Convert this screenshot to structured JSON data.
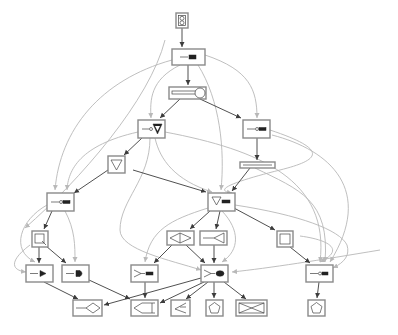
{
  "diagram": {
    "type": "directed-graph",
    "colors": {
      "background": "#ffffff",
      "node_border": "#8a8a8a",
      "edge_primary": "#3c3c3c",
      "edge_secondary": "#b8b8b8",
      "glyph": "#444444"
    },
    "nodes": [
      {
        "id": "n0",
        "glyph": "two-circles-in-box",
        "x": 176,
        "y": 13,
        "w": 12,
        "h": 15
      },
      {
        "id": "n1",
        "glyph": "wire-to-component",
        "x": 172,
        "y": 49,
        "w": 33,
        "h": 16
      },
      {
        "id": "n2",
        "glyph": "stretched-bar-with-circle",
        "x": 169,
        "y": 87,
        "w": 37,
        "h": 12
      },
      {
        "id": "n3",
        "glyph": "wire-to-filled-triangle",
        "x": 138,
        "y": 120,
        "w": 27,
        "h": 18
      },
      {
        "id": "n4",
        "glyph": "wire-to-component",
        "x": 243,
        "y": 120,
        "w": 27,
        "h": 18
      },
      {
        "id": "n5",
        "glyph": "inverted-triangle",
        "x": 108,
        "y": 156,
        "w": 17,
        "h": 17
      },
      {
        "id": "n6",
        "glyph": "long-bar",
        "x": 240,
        "y": 162,
        "w": 35,
        "h": 6
      },
      {
        "id": "n7",
        "glyph": "wire-to-component",
        "x": 47,
        "y": 193,
        "w": 27,
        "h": 18
      },
      {
        "id": "n8",
        "glyph": "triangle-with-component",
        "x": 208,
        "y": 193,
        "w": 27,
        "h": 18
      },
      {
        "id": "n9",
        "glyph": "square-with-arrow",
        "x": 32,
        "y": 231,
        "w": 16,
        "h": 16
      },
      {
        "id": "n10",
        "glyph": "diamond-cross",
        "x": 167,
        "y": 231,
        "w": 27,
        "h": 14
      },
      {
        "id": "n11",
        "glyph": "line-to-fork",
        "x": 200,
        "y": 231,
        "w": 27,
        "h": 14
      },
      {
        "id": "n12",
        "glyph": "square-outline",
        "x": 277,
        "y": 231,
        "w": 16,
        "h": 16
      },
      {
        "id": "n13",
        "glyph": "wire-to-gate",
        "x": 26,
        "y": 265,
        "w": 27,
        "h": 17
      },
      {
        "id": "n14",
        "glyph": "wire-to-gate",
        "x": 62,
        "y": 265,
        "w": 27,
        "h": 17
      },
      {
        "id": "n15",
        "glyph": "triangle-with-component",
        "x": 131,
        "y": 265,
        "w": 27,
        "h": 17
      },
      {
        "id": "n16",
        "glyph": "triangle-with-blob",
        "x": 201,
        "y": 265,
        "w": 27,
        "h": 17
      },
      {
        "id": "n17",
        "glyph": "wire-to-component",
        "x": 306,
        "y": 265,
        "w": 27,
        "h": 17
      },
      {
        "id": "n18",
        "glyph": "line-to-diamond",
        "x": 73,
        "y": 300,
        "w": 29,
        "h": 16
      },
      {
        "id": "n19",
        "glyph": "arrow-in-rectangle",
        "x": 131,
        "y": 300,
        "w": 27,
        "h": 16
      },
      {
        "id": "n20",
        "glyph": "triangle-fork",
        "x": 171,
        "y": 300,
        "w": 19,
        "h": 16
      },
      {
        "id": "n21",
        "glyph": "pentagon",
        "x": 206,
        "y": 300,
        "w": 17,
        "h": 16
      },
      {
        "id": "n22",
        "glyph": "bowtie-cross",
        "x": 236,
        "y": 300,
        "w": 31,
        "h": 16
      },
      {
        "id": "n23",
        "glyph": "pentagon",
        "x": 308,
        "y": 300,
        "w": 17,
        "h": 16
      }
    ],
    "edges_primary": [
      [
        "n0",
        "n1"
      ],
      [
        "n1",
        "n2"
      ],
      [
        "n2",
        "n3"
      ],
      [
        "n2",
        "n4"
      ],
      [
        "n3",
        "n5"
      ],
      [
        "n4",
        "n6"
      ],
      [
        "n5",
        "n7"
      ],
      [
        "n5",
        "n8"
      ],
      [
        "n6",
        "n8"
      ],
      [
        "n7",
        "n9"
      ],
      [
        "n8",
        "n10"
      ],
      [
        "n8",
        "n11"
      ],
      [
        "n8",
        "n12"
      ],
      [
        "n9",
        "n13"
      ],
      [
        "n9",
        "n14"
      ],
      [
        "n10",
        "n15"
      ],
      [
        "n10",
        "n16"
      ],
      [
        "n11",
        "n16"
      ],
      [
        "n12",
        "n17"
      ],
      [
        "n14",
        "n19"
      ],
      [
        "n13",
        "n18"
      ],
      [
        "n15",
        "n19"
      ],
      [
        "n16",
        "n18"
      ],
      [
        "n16",
        "n19"
      ],
      [
        "n16",
        "n20"
      ],
      [
        "n16",
        "n21"
      ],
      [
        "n16",
        "n22"
      ],
      [
        "n17",
        "n23"
      ]
    ],
    "edges_secondary_count": 20
  }
}
